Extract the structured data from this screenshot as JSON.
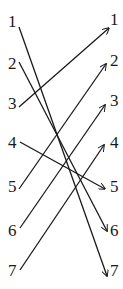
{
  "diagram": {
    "type": "bipartite-mapping",
    "left_nodes": [
      {
        "label": "1",
        "x": 8,
        "y": 27,
        "anchor": [
          19,
          27
        ]
      },
      {
        "label": "2",
        "x": 8,
        "y": 69,
        "anchor": [
          19,
          62
        ]
      },
      {
        "label": "3",
        "x": 8,
        "y": 109,
        "anchor": [
          19,
          107
        ]
      },
      {
        "label": "4",
        "x": 8,
        "y": 148,
        "anchor": [
          20,
          142
        ]
      },
      {
        "label": "5",
        "x": 8,
        "y": 192,
        "anchor": [
          19,
          189
        ]
      },
      {
        "label": "6",
        "x": 8,
        "y": 236,
        "anchor": [
          20,
          228
        ]
      },
      {
        "label": "7",
        "x": 8,
        "y": 276,
        "anchor": [
          20,
          270
        ]
      }
    ],
    "right_nodes": [
      {
        "label": "1",
        "x": 110,
        "y": 25,
        "anchor": [
          109,
          28
        ]
      },
      {
        "label": "2",
        "x": 110,
        "y": 66,
        "anchor": [
          106,
          64
        ]
      },
      {
        "label": "3",
        "x": 110,
        "y": 106,
        "anchor": [
          105,
          105
        ]
      },
      {
        "label": "4",
        "x": 110,
        "y": 148,
        "anchor": [
          104,
          145
        ]
      },
      {
        "label": "5",
        "x": 110,
        "y": 192,
        "anchor": [
          105,
          189
        ]
      },
      {
        "label": "6",
        "x": 110,
        "y": 236,
        "anchor": [
          107,
          231
        ]
      },
      {
        "label": "7",
        "x": 110,
        "y": 276,
        "anchor": [
          107,
          276
        ]
      }
    ],
    "edges": [
      {
        "from": "1",
        "to": "7"
      },
      {
        "from": "2",
        "to": "6"
      },
      {
        "from": "3",
        "to": "1"
      },
      {
        "from": "4",
        "to": "5"
      },
      {
        "from": "5",
        "to": "2"
      },
      {
        "from": "6",
        "to": "3"
      },
      {
        "from": "7",
        "to": "4"
      }
    ],
    "colors": {
      "line": "#1a1a1a",
      "background": "#ffffff"
    }
  }
}
